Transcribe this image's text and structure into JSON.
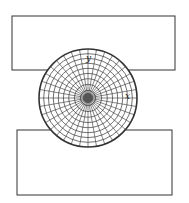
{
  "diagram": {
    "title": "",
    "colors": {
      "stroke": "#333333",
      "background": "#ffffff"
    },
    "top_platen": {
      "x": 12,
      "y": 16,
      "w": 163,
      "h": 54
    },
    "bottom_platen": {
      "x": 17,
      "y": 130,
      "w": 155,
      "h": 65
    },
    "disc": {
      "cx": 88,
      "cy": 98,
      "r": 49,
      "rings": 9,
      "spokes": 36
    },
    "axes": {
      "y_label": "y",
      "x_label": "x"
    }
  }
}
